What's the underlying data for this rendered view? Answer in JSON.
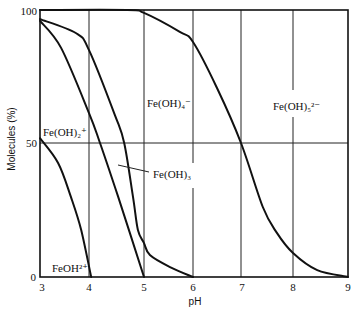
{
  "chart_data": {
    "type": "line",
    "title": "",
    "xlabel": "pH",
    "ylabel": "Molecules (%)",
    "xlim": [
      3,
      9
    ],
    "ylim": [
      0,
      100
    ],
    "xticks": [
      "3",
      "4",
      "5",
      "6",
      "7",
      "8",
      "9"
    ],
    "yticks": [
      "0",
      "50",
      "100"
    ],
    "grid": true,
    "gridlines_x": [
      4,
      5,
      6,
      7,
      8
    ],
    "gridlines_y": [
      50
    ],
    "legend": null,
    "series": [
      {
        "name": "FeOH2+ / Fe(OH)2+ boundary",
        "points": [
          [
            3.0,
            52
          ],
          [
            3.37,
            42.7
          ],
          [
            3.63,
            30
          ],
          [
            3.84,
            17.6
          ],
          [
            4.04,
            0
          ]
        ]
      },
      {
        "name": "Fe(OH)2+ / Fe(OH)3 boundary",
        "points": [
          [
            3.0,
            95.9
          ],
          [
            3.43,
            85.8
          ],
          [
            4.0,
            61.4
          ],
          [
            4.2,
            50.2
          ],
          [
            4.53,
            30
          ],
          [
            5.0,
            0
          ]
        ]
      },
      {
        "name": "Fe(OH)3 / Fe(OH)4- boundary",
        "points": [
          [
            3.0,
            96.6
          ],
          [
            3.73,
            91.4
          ],
          [
            4.0,
            85
          ],
          [
            4.47,
            60.7
          ],
          [
            4.64,
            50.2
          ],
          [
            4.8,
            30
          ],
          [
            4.89,
            17.6
          ],
          [
            5.0,
            12.7
          ],
          [
            5.12,
            8.2
          ],
          [
            5.53,
            3.7
          ],
          [
            6.0,
            0
          ]
        ]
      },
      {
        "name": "Fe(OH)4- / Fe(OH)5 2- boundary",
        "points": [
          [
            3.0,
            100
          ],
          [
            4.7,
            100
          ],
          [
            5.0,
            98.9
          ],
          [
            5.73,
            91.8
          ],
          [
            6.0,
            88
          ],
          [
            6.5,
            70.8
          ],
          [
            7.0,
            50.2
          ],
          [
            7.42,
            26.2
          ],
          [
            7.69,
            16.5
          ],
          [
            8.0,
            9
          ],
          [
            8.44,
            2.6
          ],
          [
            9.0,
            0
          ]
        ]
      }
    ],
    "annotations": [
      {
        "text": "FeOH²⁺",
        "region": "below first curve, pH 3-4"
      },
      {
        "text": "Fe(OH)₂⁺",
        "region": "between first and second curves"
      },
      {
        "text": "Fe(OH)₃",
        "region": "between second and third curves (pointer)"
      },
      {
        "text": "Fe(OH)₄⁻",
        "region": "between third and fourth curves"
      },
      {
        "text": "Fe(OH)₅²⁻",
        "region": "above fourth curve, pH 7-9"
      }
    ]
  },
  "labels": {
    "species": {
      "feoh": "FeOH²⁺",
      "feoh2": "Fe(OH)₂⁺",
      "feoh3": "Fe(OH)₃",
      "feoh4": "Fe(OH)₄⁻",
      "feoh5": "Fe(OH)₅²⁻"
    }
  }
}
